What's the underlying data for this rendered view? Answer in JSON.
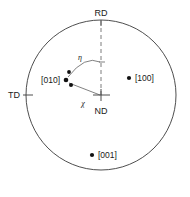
{
  "figure": {
    "type": "stereographic-pole-figure",
    "background_color": "#ffffff",
    "outline_color": "#3a3a3a",
    "dot_color": "#111111",
    "dashed_color": "#6e6e6e"
  },
  "circle": {
    "cx": 101,
    "cy": 95,
    "r": 75
  },
  "axes": [
    {
      "key": "rd",
      "label": "RD",
      "position": "top",
      "label_x": 101,
      "label_y": 14,
      "tick_x1": 101,
      "tick_y1": 20,
      "tick_x2": 101,
      "tick_y2": 26
    },
    {
      "key": "td",
      "label": "TD",
      "position": "left",
      "label_x": 16,
      "label_y": 98,
      "tick_x1": 23,
      "tick_y1": 95,
      "tick_x2": 33,
      "tick_y2": 95
    },
    {
      "key": "nd",
      "label": "ND",
      "position": "center",
      "label_x": 101,
      "label_y": 122,
      "tick_x1": 94,
      "tick_y1": 95,
      "tick_x2": 109,
      "tick_y2": 95
    }
  ],
  "nd_vertical_tick": {
    "x1": 101,
    "y1": 89,
    "x2": 101,
    "y2": 101
  },
  "dashed_axis": {
    "x1": 101,
    "y1": 21,
    "x2": 101,
    "y2": 95,
    "from": "RD",
    "to": "ND"
  },
  "angles": [
    {
      "key": "eta",
      "symbol": "η",
      "label_x": 80,
      "label_y": 60,
      "arc_path": "M 68,77 Q 84,56 100,62",
      "description": "arc from pole cluster to RD dashed axis"
    },
    {
      "key": "chi",
      "symbol": "χ",
      "label_x": 83,
      "label_y": 105,
      "ray_x1": 69,
      "ray_y1": 83,
      "ray_x2": 100,
      "ray_y2": 95,
      "description": "ray from pole cluster to ND center"
    }
  ],
  "eta_tick": {
    "x1": 100,
    "y1": 62,
    "x2": 104,
    "y2": 62
  },
  "poles": [
    {
      "label": "[010]",
      "dot_x": 66,
      "dot_y": 80,
      "label_x": 59,
      "label_y": 83,
      "label_anchor": "end"
    },
    {
      "label": "[100]",
      "dot_x": 129,
      "dot_y": 78,
      "label_x": 135,
      "label_y": 81,
      "label_anchor": "start"
    },
    {
      "label": "[001]",
      "dot_x": 92,
      "dot_y": 155,
      "label_x": 98,
      "label_y": 158,
      "label_anchor": "start"
    }
  ],
  "cluster_dots": [
    {
      "x": 69,
      "y": 72,
      "r": 1.9
    },
    {
      "x": 66,
      "y": 80,
      "r": 2.3
    },
    {
      "x": 71,
      "y": 85,
      "r": 2.0
    }
  ],
  "pole_dot_radius": 2.1
}
